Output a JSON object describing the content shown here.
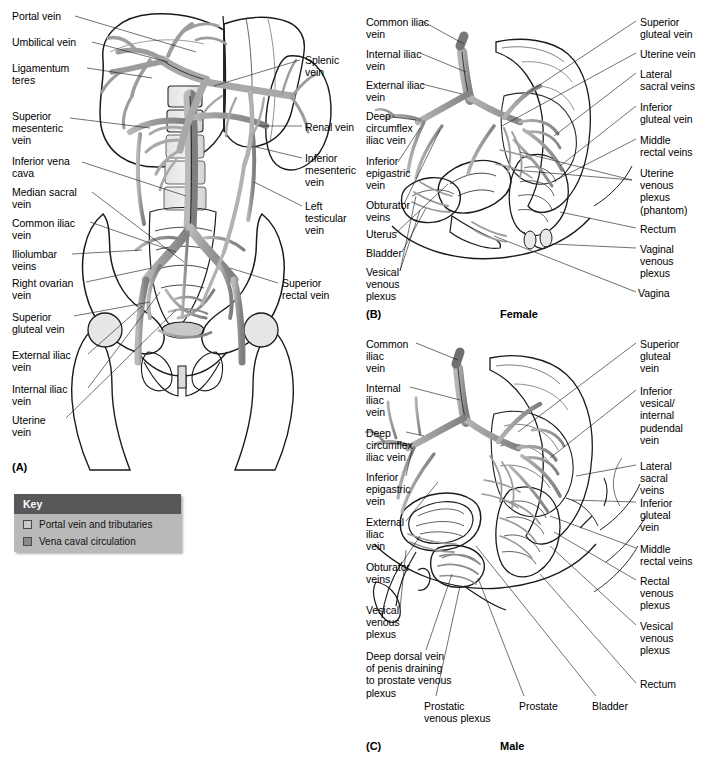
{
  "figure": {
    "type": "anatomical-illustration",
    "panel_count": 3
  },
  "key": {
    "title": "Key",
    "items": [
      {
        "label": "Portal vein and tributaries",
        "color": "#c9c9c9"
      },
      {
        "label": "Vena caval circulation",
        "color": "#8a8a8a"
      }
    ],
    "header_color": "#585858",
    "body_color": "#b9b9b9"
  },
  "panels": [
    {
      "id": "(A)",
      "caption": "",
      "labels_left": [
        {
          "text": "Portal vein",
          "x": 12,
          "y": 10
        },
        {
          "text": "Umbilical vein",
          "x": 12,
          "y": 36
        },
        {
          "text": "Ligamentum\nteres",
          "x": 12,
          "y": 62
        },
        {
          "text": "Superior\nmesenteric\nvein",
          "x": 12,
          "y": 110
        },
        {
          "text": "Inferior vena\ncava",
          "x": 12,
          "y": 155
        },
        {
          "text": "Median sacral\nvein",
          "x": 12,
          "y": 186
        },
        {
          "text": "Common iliac\nvein",
          "x": 12,
          "y": 217
        },
        {
          "text": "Iliolumbar\nveins",
          "x": 12,
          "y": 248
        },
        {
          "text": "Right ovarian\nvein",
          "x": 12,
          "y": 277
        },
        {
          "text": "Superior\ngluteal vein",
          "x": 12,
          "y": 311
        },
        {
          "text": "External iliac\nvein",
          "x": 12,
          "y": 349
        },
        {
          "text": "Internal iliac\nvein",
          "x": 12,
          "y": 383
        },
        {
          "text": "Uterine\nvein",
          "x": 12,
          "y": 414
        }
      ],
      "labels_right": [
        {
          "text": "Splenic\nvein",
          "x": 305,
          "y": 54
        },
        {
          "text": "Renal vein",
          "x": 305,
          "y": 121
        },
        {
          "text": "Inferior\nmesenteric\nvein",
          "x": 305,
          "y": 152
        },
        {
          "text": "Left\ntesticular\nvein",
          "x": 305,
          "y": 200
        },
        {
          "text": "Superior\nrectal vein",
          "x": 282,
          "y": 277
        }
      ]
    },
    {
      "id": "(B)",
      "caption": "Female",
      "labels_left": [
        {
          "text": "Common iliac\nvein",
          "x": 366,
          "y": 16
        },
        {
          "text": "Internal iliac\nvein",
          "x": 366,
          "y": 48
        },
        {
          "text": "External iliac\nvein",
          "x": 366,
          "y": 79
        },
        {
          "text": "Deep\ncircumflex\niliac vein",
          "x": 366,
          "y": 110
        },
        {
          "text": "Inferior\nepigastric\nvein",
          "x": 366,
          "y": 155
        },
        {
          "text": "Obturator\nveins",
          "x": 366,
          "y": 199
        },
        {
          "text": "Uterus",
          "x": 366,
          "y": 228
        },
        {
          "text": "Bladder",
          "x": 366,
          "y": 247
        },
        {
          "text": "Vesical\nvenous\nplexus",
          "x": 366,
          "y": 266
        }
      ],
      "labels_right": [
        {
          "text": "Superior\ngluteal vein",
          "x": 640,
          "y": 16
        },
        {
          "text": "Uterine vein",
          "x": 640,
          "y": 48
        },
        {
          "text": "Lateral\nsacral veins",
          "x": 640,
          "y": 68
        },
        {
          "text": "Inferior\ngluteal vein",
          "x": 640,
          "y": 101
        },
        {
          "text": "Middle\nrectal veins",
          "x": 640,
          "y": 134
        },
        {
          "text": "Uterine\nvenous\nplexus\n(phantom)",
          "x": 640,
          "y": 167
        },
        {
          "text": "Rectum",
          "x": 640,
          "y": 223
        },
        {
          "text": "Vaginal\nvenous\nplexus",
          "x": 640,
          "y": 243
        },
        {
          "text": "Vagina",
          "x": 640,
          "y": 287
        }
      ]
    },
    {
      "id": "(C)",
      "caption": "Male",
      "labels_left": [
        {
          "text": "Common\niliac\nvein",
          "x": 366,
          "y": 338
        },
        {
          "text": "Internal\niliac\nvein",
          "x": 366,
          "y": 382
        },
        {
          "text": "Deep\ncircumflex\niliac vein",
          "x": 366,
          "y": 427
        },
        {
          "text": "Inferior\nepigastric\nvein",
          "x": 366,
          "y": 471
        },
        {
          "text": "External\niliac\nvein",
          "x": 366,
          "y": 516
        },
        {
          "text": "Obturator\nveins",
          "x": 366,
          "y": 561
        },
        {
          "text": "Vesical\nvenous\nplexus",
          "x": 366,
          "y": 604
        },
        {
          "text": "Deep dorsal vein\nof penis draining\nto prostate venous\nplexus",
          "x": 366,
          "y": 650
        }
      ],
      "labels_right": [
        {
          "text": "Superior\ngluteal\nvein",
          "x": 640,
          "y": 338
        },
        {
          "text": "Inferior\nvesical/\ninternal\npudendal\nvein",
          "x": 640,
          "y": 385
        },
        {
          "text": "Lateral\nsacral\nveins",
          "x": 640,
          "y": 460
        },
        {
          "text": "Inferior\ngluteal\nvein",
          "x": 640,
          "y": 497
        },
        {
          "text": "Middle\nrectal veins",
          "x": 640,
          "y": 543
        },
        {
          "text": "Rectal\nvenous\nplexus",
          "x": 640,
          "y": 575
        },
        {
          "text": "Vesical\nvenous\nplexus",
          "x": 640,
          "y": 620
        },
        {
          "text": "Rectum",
          "x": 640,
          "y": 678
        }
      ],
      "labels_bottom": [
        {
          "text": "Prostatic\nvenous plexus",
          "x": 424,
          "y": 700
        },
        {
          "text": "Prostate",
          "x": 519,
          "y": 700
        },
        {
          "text": "Bladder",
          "x": 592,
          "y": 700
        }
      ]
    }
  ],
  "colors": {
    "ink": "#1b1b1b",
    "leader": "#1a1a1a",
    "portal_fill": "#c9c9c9",
    "caval_fill": "#8a8a8a",
    "bone_light": "#ededed",
    "bone_mid": "#d8d8d8",
    "organ_mid": "#b5b5b5",
    "organ_dark": "#8f8f8f",
    "background": "#ffffff"
  }
}
